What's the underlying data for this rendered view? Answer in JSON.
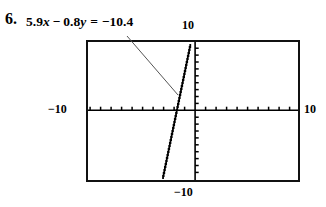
{
  "problem": {
    "number": "6.",
    "equation_plain": "5.9x − 0.8y = −10.4",
    "coef_x": "5.9",
    "coef_y": "0.8",
    "constant": "−10.4",
    "var_x": "x",
    "var_y": "y",
    "op_minus": "−",
    "op_equals": "="
  },
  "calculator": {
    "window_labels": {
      "ymax": "10",
      "ymin": "−10",
      "xmin": "−10",
      "xmax": "10"
    },
    "colors": {
      "screen_border": "#111111",
      "axis": "#000000",
      "curve": "#000000",
      "leader": "#555555",
      "background": "#ffffff"
    }
  },
  "chart_data": {
    "type": "line",
    "xlabel": "",
    "ylabel": "",
    "xlim": [
      -10,
      10
    ],
    "ylim": [
      -10,
      10
    ],
    "grid": false,
    "legend": null,
    "tick_interval_x": 1,
    "tick_interval_y": 1,
    "equation": {
      "standard_form": "5.9x - 0.8y = -10.4",
      "slope_intercept_form": "y = 7.375x + 13",
      "slope": 7.375,
      "y_intercept": 13,
      "x_intercept": -1.7627
    },
    "series": [
      {
        "name": "5.9x − 0.8y = −10.4",
        "x": [
          -3.1864,
          -1.7627,
          -0.4068,
          0
        ],
        "y": [
          -10,
          0,
          10,
          13
        ],
        "style": "stair-stepped pixel line, steep positive slope"
      }
    ],
    "annotations": [
      {
        "text": "5.9x − 0.8y = −10.4",
        "leader_from": [
          127,
          36
        ],
        "leader_to": [
          178,
          95
        ],
        "points_to_curve": true
      }
    ]
  }
}
